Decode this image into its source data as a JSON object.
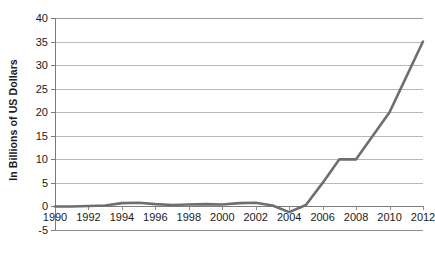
{
  "chart_data": {
    "type": "line",
    "title": "",
    "subtitle": "",
    "xlabel": "",
    "ylabel": "In Billions of US Dollars",
    "x": [
      1990,
      1991,
      1992,
      1993,
      1994,
      1995,
      1996,
      1997,
      1998,
      1999,
      2000,
      2001,
      2002,
      2003,
      2004,
      2005,
      2006,
      2007,
      2008,
      2009,
      2010,
      2011,
      2012
    ],
    "values": [
      0.0,
      0.0,
      0.1,
      0.2,
      0.7,
      0.8,
      0.5,
      0.3,
      0.4,
      0.5,
      0.4,
      0.7,
      0.8,
      0.2,
      -1.2,
      0.3,
      5.0,
      10.0,
      10.0,
      15.0,
      20.0,
      27.5,
      35.0
    ],
    "series": [
      {
        "name": "",
        "color": "#6e6e6e",
        "values": [
          0.0,
          0.0,
          0.1,
          0.2,
          0.7,
          0.8,
          0.5,
          0.3,
          0.4,
          0.5,
          0.4,
          0.7,
          0.8,
          0.2,
          -1.2,
          0.3,
          5.0,
          10.0,
          10.0,
          15.0,
          20.0,
          27.5,
          35.0
        ]
      }
    ],
    "ylim": [
      -5,
      40
    ],
    "xlim": [
      1990,
      2012
    ],
    "ytick_labels": [
      "40",
      "35",
      "30",
      "25",
      "20",
      "15",
      "10",
      "5",
      "0",
      "-5"
    ],
    "ytick_values": [
      40,
      35,
      30,
      25,
      20,
      15,
      10,
      5,
      0,
      -5
    ],
    "xtick_labels": [
      "1990",
      "1992",
      "1994",
      "1996",
      "1998",
      "2000",
      "2002",
      "2004",
      "2006",
      "2008",
      "2010",
      "2012"
    ],
    "xtick_values": [
      1990,
      1992,
      1994,
      1996,
      1998,
      2000,
      2002,
      2004,
      2006,
      2008,
      2010,
      2012
    ],
    "grid": "horizontal",
    "legend": "none",
    "annotations": []
  },
  "caption": {
    "text": ""
  },
  "colors": {
    "series_line": "#6e6e6e",
    "gridline": "#b8b8b8",
    "axis": "#7a7a7a",
    "background": "#ffffff",
    "text": "#1a1a1a"
  }
}
